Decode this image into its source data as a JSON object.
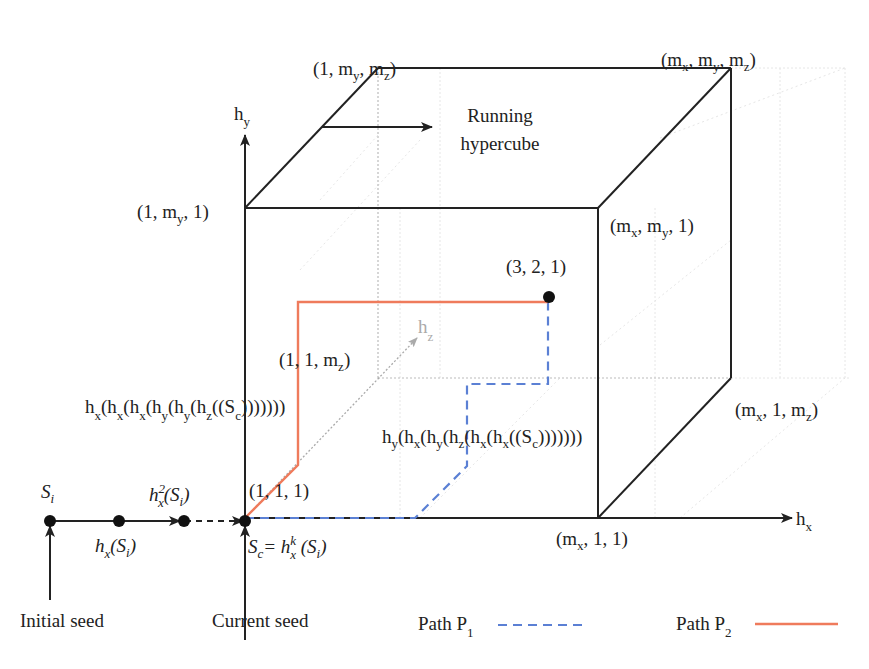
{
  "diagram": {
    "title_note": "Running hypercube with seed paths",
    "colors": {
      "edge": "#222222",
      "hidden_edge": "#bbbbbb",
      "path_p1": "#5b80d4",
      "path_p2": "#ef7b5c",
      "hz_axis": "#aaaaaa"
    },
    "axes": {
      "hy": {
        "base": "h",
        "sub": "y"
      },
      "hx": {
        "base": "h",
        "sub": "x"
      },
      "hz": {
        "base": "h",
        "sub": "z"
      }
    },
    "corners": {
      "top_back_left": {
        "pre": "(1, m",
        "s1": "y",
        "mid": ", m",
        "s2": "z",
        "post": ")"
      },
      "top_back_right": {
        "pre": "(m",
        "s1": "x",
        "mid": ", m",
        "s2": "y",
        "mid2": ", m",
        "s3": "z",
        "post": ")"
      },
      "front_top_left": {
        "pre": "(1, m",
        "s1": "y",
        "post": ", 1)"
      },
      "front_top_right": {
        "pre": "(m",
        "s1": "x",
        "mid": ", m",
        "s2": "y",
        "post": ", 1)"
      },
      "back_bottom_right": {
        "pre": "(m",
        "s1": "x",
        "mid": ", 1, m",
        "s2": "z",
        "post": ")"
      },
      "front_bottom_right": {
        "pre": "(m",
        "s1": "x",
        "post": ", 1, 1)"
      },
      "origin": "(1, 1, 1)",
      "back_bottom_left": {
        "pre": "(1, 1, m",
        "s1": "z",
        "post": ")"
      }
    },
    "target_point": "(3, 2, 1)",
    "running_label": [
      "Running",
      "hypercube"
    ],
    "path_p2_expr": [
      "h",
      "x",
      "(h",
      "x",
      "(h",
      "x",
      "(h",
      "y",
      "(h",
      "y",
      "(h",
      "z",
      "((S",
      "c",
      ")))))))"
    ],
    "path_p1_expr": [
      "h",
      "y",
      "(h",
      "x",
      "(h",
      "y",
      "(h",
      "z",
      "(h",
      "x",
      "(h",
      "x",
      "((S",
      "c",
      ")))))))"
    ],
    "seeds": {
      "si": {
        "base": "S",
        "sub": "i"
      },
      "hx_si": {
        "base": "h",
        "sub": "x",
        "arg": "(S",
        "argsub": "i",
        "close": ")"
      },
      "hx2_si": {
        "base": "h",
        "sup": "2",
        "sub": "x",
        "arg": "(S",
        "argsub": "i",
        "close": ")"
      },
      "sc": {
        "base": "S",
        "sub": "c",
        "eq": "= h",
        "sup": "k",
        "sub2": "x",
        "arg": " (S",
        "argsub": "i",
        "close": ")"
      },
      "initial_label": "Initial seed",
      "current_label": "Current seed"
    },
    "legend": [
      {
        "label": "Path P",
        "sub": "1",
        "style": "dashed",
        "color": "#5b80d4"
      },
      {
        "label": "Path P",
        "sub": "2",
        "style": "solid",
        "color": "#ef7b5c"
      }
    ]
  }
}
